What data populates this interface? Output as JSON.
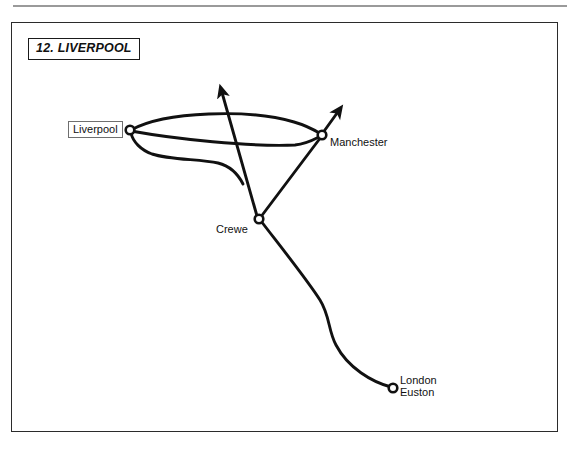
{
  "page": {
    "background_color": "#ffffff",
    "rule_color": "#9a9a9a",
    "panel_border_color": "#2b2b2b",
    "ink_color": "#111111"
  },
  "figure": {
    "caption": "12. LIVERPOOL"
  },
  "stations": [
    {
      "id": "liverpool",
      "label": "Liverpool",
      "boxed": true,
      "x": 130,
      "y": 130,
      "marker": "open-circle"
    },
    {
      "id": "manchester",
      "label": "Manchester",
      "boxed": false,
      "x": 322,
      "y": 135,
      "marker": "open-circle"
    },
    {
      "id": "crewe",
      "label": "Crewe",
      "boxed": false,
      "x": 259,
      "y": 219,
      "marker": "open-circle"
    },
    {
      "id": "london-euston",
      "label": "London\nEuston",
      "label_line1": "London",
      "label_line2": "Euston",
      "boxed": false,
      "x": 393,
      "y": 388,
      "marker": "open-circle"
    }
  ],
  "routes": [
    {
      "id": "liverpool-manchester-north",
      "from": "liverpool",
      "to": "manchester",
      "style": "curve-arc-north"
    },
    {
      "id": "liverpool-manchester-direct",
      "from": "liverpool",
      "to": "manchester",
      "style": "curve-shallow"
    },
    {
      "id": "liverpool-crewe-line",
      "from": "liverpool",
      "to": "crewe-line",
      "style": "curve-dip-south"
    },
    {
      "id": "crewe-north-arrow",
      "from": "crewe",
      "to": "off-map-north",
      "style": "straight",
      "arrow": true
    },
    {
      "id": "manchester-northeast-arrow",
      "from": "manchester",
      "to": "off-map-northeast",
      "style": "straight",
      "arrow": true
    },
    {
      "id": "crewe-manchester",
      "from": "crewe",
      "to": "manchester",
      "style": "straight"
    },
    {
      "id": "crewe-london-euston",
      "from": "crewe",
      "to": "london-euston",
      "style": "s-curve"
    }
  ]
}
